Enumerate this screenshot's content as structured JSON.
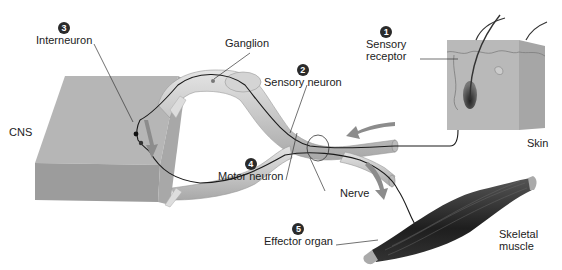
{
  "labels": {
    "interneuron": {
      "step": "3",
      "text": "Interneuron"
    },
    "ganglion": {
      "text": "Ganglion"
    },
    "sensory_receptor": {
      "step": "1",
      "line1": "Sensory",
      "line2": "receptor"
    },
    "sensory_neuron": {
      "step": "2",
      "text": "Sensory neuron"
    },
    "cns": {
      "text": "CNS"
    },
    "skin": {
      "text": "Skin"
    },
    "motor_neuron": {
      "step": "4",
      "text": "Motor neuron"
    },
    "nerve": {
      "text": "Nerve"
    },
    "effector_organ": {
      "step": "5",
      "text": "Effector organ"
    },
    "skeletal_muscle": {
      "line1": "Skeletal",
      "line2": "muscle"
    }
  },
  "colors": {
    "cns_top": "#b4b4b4",
    "cns_front": "#9a9a9a",
    "nerve_fill": "#cfcfcf",
    "skin": "#b8b8b8",
    "muscle": "#2e2e2e",
    "arrow": "#8a8a8a",
    "text": "#222222"
  }
}
